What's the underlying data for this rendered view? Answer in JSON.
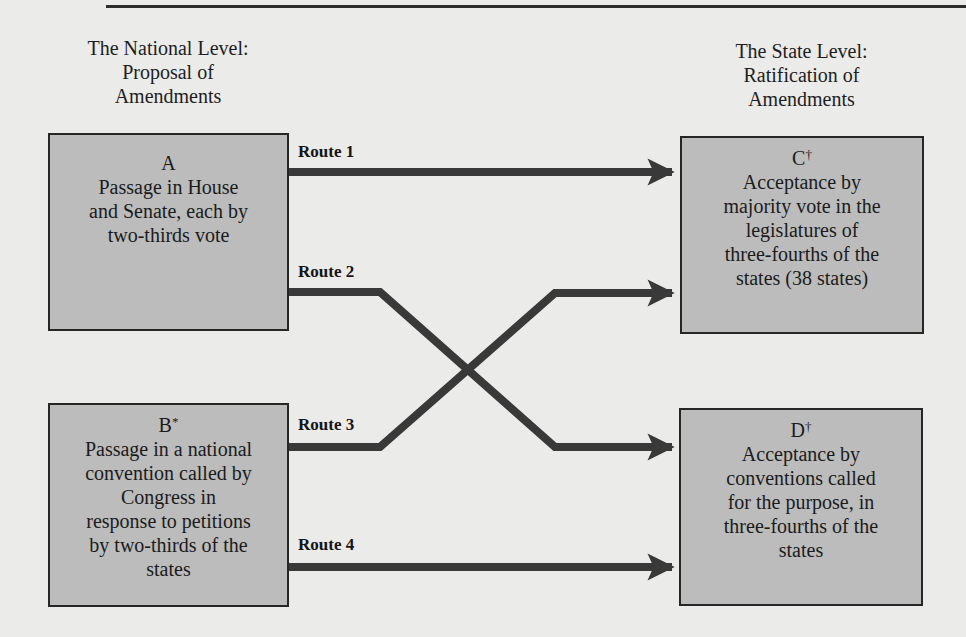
{
  "headings": {
    "national": [
      "The National Level:",
      "Proposal of",
      "Amendments"
    ],
    "state": [
      "The State Level:",
      "Ratification of",
      "Amendments"
    ]
  },
  "boxes": {
    "a": {
      "letter": "A",
      "mark": "",
      "lines": [
        "Passage in House",
        "and Senate, each by",
        "two-thirds vote"
      ]
    },
    "b": {
      "letter": "B",
      "mark": "*",
      "lines": [
        "Passage in a national",
        "convention called by",
        "Congress in",
        "response to petitions",
        "by two-thirds of the",
        "states"
      ]
    },
    "c": {
      "letter": "C",
      "mark": "†",
      "lines": [
        "Acceptance by",
        "majority vote in the",
        "legislatures of",
        "three-fourths of the",
        "states (38 states)"
      ]
    },
    "d": {
      "letter": "D",
      "mark": "†",
      "lines": [
        "Acceptance by",
        "conventions called",
        "for the purpose, in",
        "three-fourths of the",
        "states"
      ]
    }
  },
  "routes": [
    {
      "label": "Route 1",
      "from": "A",
      "to": "C"
    },
    {
      "label": "Route 2",
      "from": "A",
      "to": "D"
    },
    {
      "label": "Route 3",
      "from": "B",
      "to": "C"
    },
    {
      "label": "Route 4",
      "from": "B",
      "to": "D"
    }
  ],
  "colors": {
    "background": "#ebebea",
    "box_fill": "#bcbcbc",
    "box_border": "#262626",
    "arrow": "#393939"
  }
}
